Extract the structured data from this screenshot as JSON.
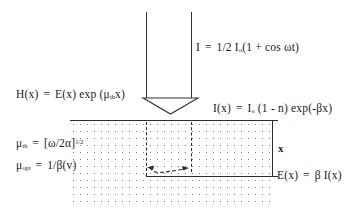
{
  "figure": {
    "background_color": "#ffffff",
    "line_color": "#2b2b2b",
    "text_color": "#1a1a1a"
  },
  "equations": {
    "incident_intensity": {
      "lhs": "I",
      "eq": "=",
      "rhs_prefix": "1/2 I",
      "rhs_subscript": "o",
      "rhs_suffix": "(1 + cos ωt)",
      "full_text": "I = 1/2 Iₒ(1 + cos ωt)"
    },
    "thermal_wave": {
      "lhs": "H(x)",
      "eq": "=",
      "rhs_prefix": "E(x) exp (μ",
      "rhs_subscript": "th",
      "rhs_suffix": "x)",
      "full_text": "H(x) = E(x) exp (μₜₕx)"
    },
    "beer_lambert": {
      "lhs": "I(x)",
      "eq": "=",
      "rhs_prefix": "I",
      "rhs_subscript": "o",
      "rhs_suffix": " (1 - n) exp(-βx)",
      "full_text": "I(x) = Iₒ (1 - n) exp(-βx)"
    },
    "thermal_diffusion_length": {
      "lhs": "μ",
      "lhs_subscript": "th",
      "eq": "=",
      "rhs_prefix": "[ω/2α]",
      "rhs_superscript": "1/2",
      "full_text": "μₜₕ = [ω/2α]¹ᐟ²"
    },
    "optical_absorption_length": {
      "lhs": "μ",
      "lhs_subscript": "opt",
      "eq": "=",
      "rhs_prefix": "1/β(v)",
      "full_text": "μₒₚₜ = 1/β(v)"
    },
    "energy_deposition": {
      "lhs": "E(x)",
      "eq": "=",
      "rhs_prefix": "β I(x)",
      "full_text": "E(x) = β I(x)"
    }
  },
  "labels": {
    "depth": "x"
  },
  "graphics": {
    "beam_arrow": "downward-light-beam-arrow",
    "sample": "stippled-sample-medium",
    "depth_marker": "depth-extent-marker",
    "double_arrow": "curved-double-headed-arrow"
  }
}
